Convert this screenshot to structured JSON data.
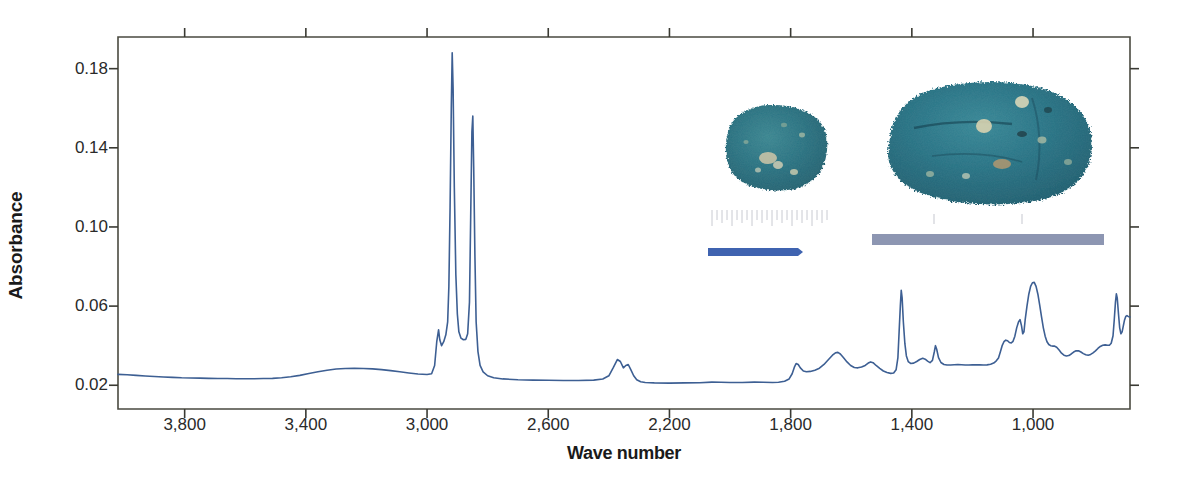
{
  "chart_data": {
    "type": "line",
    "title": "",
    "xlabel": "Wave number",
    "ylabel": "Absorbance",
    "xlim": [
      4020,
      680
    ],
    "ylim": [
      0.008,
      0.196
    ],
    "x_reversed": true,
    "grid": false,
    "legend": null,
    "xticks": [
      3800,
      3400,
      3000,
      2600,
      2200,
      1800,
      1400,
      1000
    ],
    "xtick_labels": [
      "3,800",
      "3,400",
      "3,000",
      "2,600",
      "2,200",
      "1,800",
      "1,400",
      "1,000"
    ],
    "yticks": [
      0.02,
      0.06,
      0.1,
      0.14,
      0.18
    ],
    "ytick_labels": [
      "0.02",
      "0.06",
      "0.10",
      "0.14",
      "0.18"
    ],
    "line_color": "#3d5f93",
    "line_width": 1.6,
    "series": [
      {
        "name": "FTIR absorbance spectrum",
        "points": [
          [
            4020,
            0.0255
          ],
          [
            3990,
            0.0253
          ],
          [
            3960,
            0.025
          ],
          [
            3930,
            0.0247
          ],
          [
            3900,
            0.0244
          ],
          [
            3870,
            0.0242
          ],
          [
            3840,
            0.024
          ],
          [
            3810,
            0.0238
          ],
          [
            3780,
            0.0237
          ],
          [
            3750,
            0.0236
          ],
          [
            3720,
            0.0235
          ],
          [
            3690,
            0.0234
          ],
          [
            3660,
            0.0234
          ],
          [
            3630,
            0.0233
          ],
          [
            3600,
            0.0233
          ],
          [
            3570,
            0.0233
          ],
          [
            3540,
            0.0234
          ],
          [
            3510,
            0.0235
          ],
          [
            3480,
            0.0238
          ],
          [
            3450,
            0.0243
          ],
          [
            3420,
            0.025
          ],
          [
            3390,
            0.0259
          ],
          [
            3360,
            0.0268
          ],
          [
            3330,
            0.0276
          ],
          [
            3300,
            0.0282
          ],
          [
            3270,
            0.0285
          ],
          [
            3240,
            0.0286
          ],
          [
            3210,
            0.0285
          ],
          [
            3180,
            0.0283
          ],
          [
            3150,
            0.0279
          ],
          [
            3120,
            0.0274
          ],
          [
            3090,
            0.0268
          ],
          [
            3060,
            0.0262
          ],
          [
            3030,
            0.0257
          ],
          [
            3000,
            0.0254
          ],
          [
            2985,
            0.0258
          ],
          [
            2975,
            0.03
          ],
          [
            2968,
            0.042
          ],
          [
            2962,
            0.048
          ],
          [
            2958,
            0.043
          ],
          [
            2952,
            0.04
          ],
          [
            2945,
            0.042
          ],
          [
            2938,
            0.0455
          ],
          [
            2932,
            0.052
          ],
          [
            2928,
            0.07
          ],
          [
            2924,
            0.11
          ],
          [
            2920,
            0.16
          ],
          [
            2917,
            0.188
          ],
          [
            2914,
            0.17
          ],
          [
            2910,
            0.12
          ],
          [
            2905,
            0.076
          ],
          [
            2900,
            0.056
          ],
          [
            2895,
            0.047
          ],
          [
            2888,
            0.0438
          ],
          [
            2880,
            0.043
          ],
          [
            2872,
            0.0432
          ],
          [
            2866,
            0.046
          ],
          [
            2860,
            0.062
          ],
          [
            2856,
            0.105
          ],
          [
            2852,
            0.148
          ],
          [
            2849,
            0.156
          ],
          [
            2846,
            0.13
          ],
          [
            2842,
            0.085
          ],
          [
            2838,
            0.052
          ],
          [
            2832,
            0.037
          ],
          [
            2825,
            0.03
          ],
          [
            2815,
            0.0268
          ],
          [
            2800,
            0.0248
          ],
          [
            2780,
            0.0238
          ],
          [
            2750,
            0.0232
          ],
          [
            2700,
            0.0228
          ],
          [
            2650,
            0.0226
          ],
          [
            2600,
            0.0225
          ],
          [
            2550,
            0.0224
          ],
          [
            2500,
            0.0224
          ],
          [
            2450,
            0.0226
          ],
          [
            2420,
            0.0232
          ],
          [
            2400,
            0.0248
          ],
          [
            2385,
            0.029
          ],
          [
            2372,
            0.033
          ],
          [
            2362,
            0.032
          ],
          [
            2352,
            0.0288
          ],
          [
            2344,
            0.03
          ],
          [
            2336,
            0.0305
          ],
          [
            2328,
            0.028
          ],
          [
            2318,
            0.0248
          ],
          [
            2308,
            0.0228
          ],
          [
            2295,
            0.0218
          ],
          [
            2280,
            0.0214
          ],
          [
            2250,
            0.0212
          ],
          [
            2200,
            0.0211
          ],
          [
            2150,
            0.0212
          ],
          [
            2100,
            0.0213
          ],
          [
            2060,
            0.0216
          ],
          [
            2030,
            0.0215
          ],
          [
            2000,
            0.0214
          ],
          [
            1960,
            0.0214
          ],
          [
            1920,
            0.0216
          ],
          [
            1890,
            0.0215
          ],
          [
            1860,
            0.0214
          ],
          [
            1840,
            0.0215
          ],
          [
            1820,
            0.022
          ],
          [
            1805,
            0.0232
          ],
          [
            1795,
            0.0258
          ],
          [
            1788,
            0.029
          ],
          [
            1782,
            0.031
          ],
          [
            1775,
            0.0305
          ],
          [
            1768,
            0.0288
          ],
          [
            1758,
            0.0272
          ],
          [
            1748,
            0.0268
          ],
          [
            1735,
            0.027
          ],
          [
            1720,
            0.0276
          ],
          [
            1705,
            0.0286
          ],
          [
            1690,
            0.0305
          ],
          [
            1675,
            0.033
          ],
          [
            1662,
            0.0352
          ],
          [
            1652,
            0.0364
          ],
          [
            1644,
            0.0366
          ],
          [
            1636,
            0.0358
          ],
          [
            1626,
            0.034
          ],
          [
            1614,
            0.0318
          ],
          [
            1602,
            0.03
          ],
          [
            1590,
            0.029
          ],
          [
            1578,
            0.0288
          ],
          [
            1566,
            0.0292
          ],
          [
            1554,
            0.03
          ],
          [
            1544,
            0.0312
          ],
          [
            1536,
            0.0318
          ],
          [
            1528,
            0.0314
          ],
          [
            1518,
            0.03
          ],
          [
            1506,
            0.0285
          ],
          [
            1494,
            0.0272
          ],
          [
            1482,
            0.0264
          ],
          [
            1470,
            0.026
          ],
          [
            1460,
            0.0262
          ],
          [
            1452,
            0.0278
          ],
          [
            1446,
            0.034
          ],
          [
            1442,
            0.047
          ],
          [
            1438,
            0.06
          ],
          [
            1435,
            0.068
          ],
          [
            1432,
            0.064
          ],
          [
            1428,
            0.052
          ],
          [
            1423,
            0.041
          ],
          [
            1418,
            0.0348
          ],
          [
            1412,
            0.032
          ],
          [
            1404,
            0.031
          ],
          [
            1394,
            0.0312
          ],
          [
            1384,
            0.032
          ],
          [
            1374,
            0.033
          ],
          [
            1364,
            0.0336
          ],
          [
            1356,
            0.0332
          ],
          [
            1348,
            0.0322
          ],
          [
            1340,
            0.0314
          ],
          [
            1332,
            0.0326
          ],
          [
            1326,
            0.0368
          ],
          [
            1322,
            0.04
          ],
          [
            1318,
            0.0382
          ],
          [
            1312,
            0.034
          ],
          [
            1304,
            0.0315
          ],
          [
            1294,
            0.0305
          ],
          [
            1284,
            0.0302
          ],
          [
            1272,
            0.0302
          ],
          [
            1260,
            0.0304
          ],
          [
            1248,
            0.0305
          ],
          [
            1236,
            0.0304
          ],
          [
            1224,
            0.0302
          ],
          [
            1212,
            0.0302
          ],
          [
            1200,
            0.0303
          ],
          [
            1188,
            0.0304
          ],
          [
            1176,
            0.0303
          ],
          [
            1164,
            0.0302
          ],
          [
            1152,
            0.0303
          ],
          [
            1140,
            0.0306
          ],
          [
            1130,
            0.0312
          ],
          [
            1122,
            0.0322
          ],
          [
            1114,
            0.0338
          ],
          [
            1108,
            0.0368
          ],
          [
            1102,
            0.04
          ],
          [
            1096,
            0.042
          ],
          [
            1090,
            0.0428
          ],
          [
            1084,
            0.0425
          ],
          [
            1078,
            0.0416
          ],
          [
            1072,
            0.0414
          ],
          [
            1066,
            0.0422
          ],
          [
            1060,
            0.0448
          ],
          [
            1054,
            0.049
          ],
          [
            1048,
            0.052
          ],
          [
            1043,
            0.0532
          ],
          [
            1038,
            0.05
          ],
          [
            1034,
            0.046
          ],
          [
            1030,
            0.047
          ],
          [
            1026,
            0.053
          ],
          [
            1020,
            0.06
          ],
          [
            1014,
            0.066
          ],
          [
            1008,
            0.07
          ],
          [
            1002,
            0.0718
          ],
          [
            996,
            0.072
          ],
          [
            990,
            0.07
          ],
          [
            984,
            0.066
          ],
          [
            978,
            0.0605
          ],
          [
            972,
            0.0545
          ],
          [
            966,
            0.049
          ],
          [
            960,
            0.0448
          ],
          [
            954,
            0.042
          ],
          [
            948,
            0.0406
          ],
          [
            942,
            0.04
          ],
          [
            936,
            0.0398
          ],
          [
            930,
            0.0398
          ],
          [
            922,
            0.0392
          ],
          [
            914,
            0.0378
          ],
          [
            906,
            0.0362
          ],
          [
            898,
            0.0352
          ],
          [
            890,
            0.0348
          ],
          [
            882,
            0.035
          ],
          [
            874,
            0.0358
          ],
          [
            866,
            0.0368
          ],
          [
            858,
            0.0374
          ],
          [
            850,
            0.0374
          ],
          [
            842,
            0.0368
          ],
          [
            834,
            0.036
          ],
          [
            826,
            0.0354
          ],
          [
            818,
            0.0352
          ],
          [
            810,
            0.0356
          ],
          [
            802,
            0.0364
          ],
          [
            794,
            0.0374
          ],
          [
            786,
            0.0386
          ],
          [
            778,
            0.0396
          ],
          [
            770,
            0.0402
          ],
          [
            762,
            0.0404
          ],
          [
            754,
            0.0402
          ],
          [
            748,
            0.0402
          ],
          [
            742,
            0.0412
          ],
          [
            736,
            0.045
          ],
          [
            732,
            0.053
          ],
          [
            728,
            0.062
          ],
          [
            725,
            0.0662
          ],
          [
            722,
            0.064
          ],
          [
            718,
            0.056
          ],
          [
            714,
            0.049
          ],
          [
            710,
            0.046
          ],
          [
            706,
            0.047
          ],
          [
            702,
            0.05
          ],
          [
            698,
            0.053
          ],
          [
            694,
            0.0548
          ],
          [
            690,
            0.0552
          ],
          [
            686,
            0.0548
          ],
          [
            682,
            0.0545
          ],
          [
            680,
            0.0545
          ]
        ]
      }
    ],
    "annotations": []
  },
  "axis": {
    "ylabel": "Absorbance",
    "xlabel": "Wave number"
  },
  "insets": {
    "sample_left": {
      "name": "pigment-sample-small",
      "color": "#2e6f80",
      "ruler_color": "#3f63b0"
    },
    "sample_right": {
      "name": "pigment-sample-large",
      "color": "#2b7285",
      "ruler_color": "#8d96b2"
    }
  }
}
